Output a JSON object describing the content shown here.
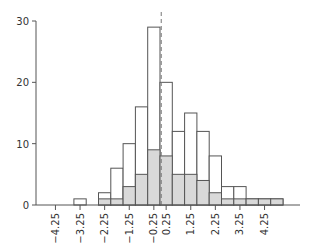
{
  "chart_data": {
    "type": "bar",
    "subtype": "overlaid-histogram",
    "title": "",
    "xlabel": "",
    "ylabel": "",
    "bin_width": 0.5,
    "bins": [
      [
        -3.5,
        -3.0
      ],
      [
        -2.5,
        -2.0
      ],
      [
        -2.0,
        -1.5
      ],
      [
        -1.5,
        -1.0
      ],
      [
        -1.0,
        -0.5
      ],
      [
        -0.5,
        0.0
      ],
      [
        0.0,
        0.5
      ],
      [
        0.5,
        1.0
      ],
      [
        1.0,
        1.5
      ],
      [
        1.5,
        2.0
      ],
      [
        2.0,
        2.5
      ],
      [
        2.5,
        3.0
      ],
      [
        3.0,
        3.5
      ],
      [
        3.5,
        4.0
      ],
      [
        4.0,
        4.5
      ],
      [
        4.5,
        5.0
      ]
    ],
    "series": [
      {
        "name": "total",
        "style": "outline",
        "color": "#ffffff",
        "values": [
          1,
          2,
          6,
          10,
          16,
          29,
          20,
          12,
          15,
          12,
          8,
          3,
          3,
          1,
          1,
          1
        ]
      },
      {
        "name": "subset",
        "style": "filled",
        "color": "#d9d9d9",
        "values": [
          0,
          1,
          1,
          3,
          5,
          9,
          8,
          5,
          5,
          4,
          2,
          1,
          1,
          1,
          1,
          1
        ]
      }
    ],
    "reference_line": {
      "x": 0.05,
      "style": "dashed"
    },
    "xticks": [
      "-4.25",
      "-3.25",
      "-2.25",
      "-1.25",
      "-0.25",
      "0.25",
      "1.25",
      "2.25",
      "3.25",
      "4.25"
    ],
    "xtick_values": [
      -4.25,
      -3.25,
      -2.25,
      -1.25,
      -0.25,
      0.25,
      1.25,
      2.25,
      3.25,
      4.25
    ],
    "yticks": [
      "0",
      "10",
      "20",
      "30"
    ],
    "ytick_values": [
      0,
      10,
      20,
      30
    ],
    "xlim": [
      -4.75,
      6.0
    ],
    "ylim": [
      0,
      30
    ],
    "grid": false,
    "legend": null
  }
}
